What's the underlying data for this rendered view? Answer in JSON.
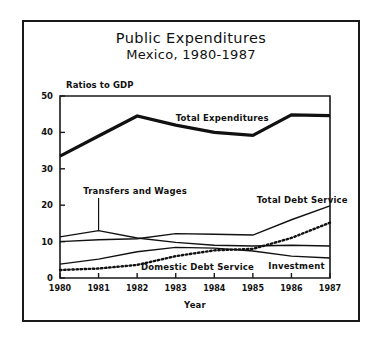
{
  "figure": {
    "title": "Public Expenditures",
    "subtitle": "Mexico, 1980-1987"
  },
  "chart_data": {
    "type": "line",
    "title": "Public Expenditures",
    "subtitle": "Mexico, 1980-1987",
    "xlabel": "Year",
    "ylabel": "Ratios to GDP",
    "x": [
      1980,
      1981,
      1982,
      1983,
      1984,
      1985,
      1986,
      1987
    ],
    "categories": [
      "1980",
      "1981",
      "1982",
      "1983",
      "1984",
      "1985",
      "1986",
      "1987"
    ],
    "xlim": [
      1980,
      1987
    ],
    "ylim": [
      0,
      50
    ],
    "yticks": [
      0,
      10,
      20,
      30,
      40,
      50
    ],
    "ytick_labels": [
      "0",
      "10",
      "20",
      "30",
      "40",
      "50"
    ],
    "xticks": [
      1980,
      1981,
      1982,
      1983,
      1984,
      1985,
      1986,
      1987
    ],
    "xtick_labels": [
      "1980",
      "1981",
      "1982",
      "1983",
      "1984",
      "1985",
      "1986",
      "1987"
    ],
    "grid": false,
    "legend": "inline-annotations",
    "series": [
      {
        "name": "Total Expenditures",
        "style": "solid-thick",
        "values": [
          33.5,
          39.0,
          44.5,
          42.0,
          40.0,
          39.2,
          44.8,
          44.6
        ]
      },
      {
        "name": "Transfers and Wages",
        "style": "solid-thin",
        "values": [
          11.3,
          13.0,
          11.0,
          9.8,
          9.0,
          8.8,
          9.0,
          8.8
        ]
      },
      {
        "name": "Total Debt Service",
        "style": "solid-thin",
        "values": [
          10.0,
          10.5,
          10.8,
          12.2,
          12.0,
          11.8,
          16.0,
          19.8
        ]
      },
      {
        "name": "Domestic Debt Service",
        "style": "dotted",
        "values": [
          2.2,
          2.6,
          3.6,
          6.0,
          7.6,
          8.0,
          11.0,
          15.2
        ]
      },
      {
        "name": "Investment",
        "style": "solid-thin",
        "values": [
          3.8,
          5.2,
          7.2,
          8.4,
          8.2,
          7.4,
          6.0,
          5.5
        ]
      }
    ],
    "annotations": [
      {
        "text": "Total Expenditures",
        "x": 1983.0,
        "y": 43.0
      },
      {
        "text": "Transfers and Wages",
        "x": 1980.6,
        "y": 23.0
      },
      {
        "text": "Total Debt Service",
        "x": 1985.1,
        "y": 20.5
      },
      {
        "text": "Domestic Debt Service",
        "x": 1982.1,
        "y": 2.1
      },
      {
        "text": "Investment",
        "x": 1985.4,
        "y": 2.6
      }
    ]
  }
}
